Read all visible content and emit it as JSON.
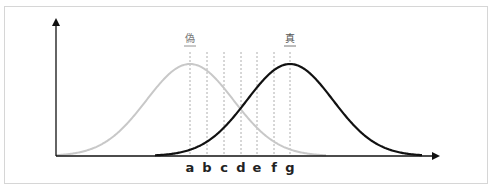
{
  "diagram": {
    "type": "overlapping-distributions",
    "curves": [
      {
        "name": "偽",
        "label": "偽",
        "color": "#c8c8c8",
        "peak_x": 190,
        "start_x": 56,
        "end_x": 326
      },
      {
        "name": "真",
        "label": "真",
        "color": "#111111",
        "peak_x": 290,
        "start_x": 155,
        "end_x": 422
      }
    ],
    "thresholds": [
      {
        "label": "a",
        "x": 190
      },
      {
        "label": "b",
        "x": 207
      },
      {
        "label": "c",
        "x": 224
      },
      {
        "label": "d",
        "x": 241
      },
      {
        "label": "e",
        "x": 257
      },
      {
        "label": "f",
        "x": 274
      },
      {
        "label": "g",
        "x": 290
      }
    ]
  }
}
